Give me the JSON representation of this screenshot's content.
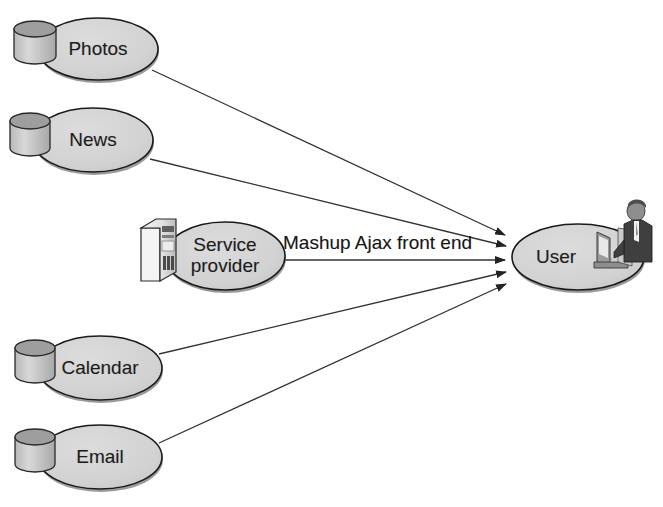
{
  "diagram": {
    "background_color": "#ffffff",
    "node_fill_color": "#d2d2d2",
    "node_stroke_color": "#1a1a1a",
    "line_color": "#333333",
    "text_color": "#1c1c1c",
    "nodes": [
      {
        "id": "photos",
        "label": "Photos",
        "icon": "database-cylinder-icon",
        "cx": 98,
        "cy": 49,
        "rx": 60,
        "ry": 31,
        "label_x": 38,
        "label_y": 38,
        "label_w": 120
      },
      {
        "id": "news",
        "label": "News",
        "icon": "database-cylinder-icon",
        "cx": 93,
        "cy": 140,
        "rx": 60,
        "ry": 32,
        "label_x": 33,
        "label_y": 129,
        "label_w": 120
      },
      {
        "id": "service-provider",
        "label": "Service\nprovider",
        "icon": "server-tower-icon",
        "cx": 225,
        "cy": 256,
        "rx": 60,
        "ry": 34,
        "label_x": 165,
        "label_y": 234,
        "label_w": 120
      },
      {
        "id": "calendar",
        "label": "Calendar",
        "icon": "database-cylinder-icon",
        "cx": 100,
        "cy": 368,
        "rx": 62,
        "ry": 32,
        "label_x": 38,
        "label_y": 357,
        "label_w": 124
      },
      {
        "id": "email",
        "label": "Email",
        "icon": "database-cylinder-icon",
        "cx": 100,
        "cy": 457,
        "rx": 62,
        "ry": 32,
        "label_x": 38,
        "label_y": 446,
        "label_w": 124
      },
      {
        "id": "user",
        "label": "User",
        "icon": "person-at-computer-icon",
        "cx": 578,
        "cy": 257,
        "rx": 66,
        "ry": 33,
        "label_x": 518,
        "label_y": 246,
        "label_w": 120
      }
    ],
    "edges": [
      {
        "id": "photos-to-user",
        "from": "photos",
        "to": "user",
        "label": "",
        "x1": 152,
        "y1": 70,
        "x2": 511,
        "y2": 236,
        "arrow": true
      },
      {
        "id": "news-to-user",
        "from": "news",
        "to": "user",
        "label": "",
        "x1": 150,
        "y1": 159,
        "x2": 512,
        "y2": 246,
        "arrow": true
      },
      {
        "id": "service-provider-to-user",
        "from": "service-provider",
        "to": "user",
        "label": "Mashup Ajax front end",
        "x1": 283,
        "y1": 260,
        "x2": 510,
        "y2": 260,
        "arrow": true
      },
      {
        "id": "calendar-to-user",
        "from": "calendar",
        "to": "user",
        "label": "",
        "x1": 159,
        "y1": 354,
        "x2": 512,
        "y2": 272,
        "arrow": true
      },
      {
        "id": "email-to-user",
        "from": "email",
        "to": "user",
        "label": "",
        "x1": 159,
        "y1": 443,
        "x2": 512,
        "y2": 283,
        "arrow": true
      }
    ],
    "edge_labels": [
      {
        "id": "mashup-ajax-front-end-label",
        "text": "Mashup Ajax front end",
        "x": 283,
        "y": 234
      }
    ]
  }
}
